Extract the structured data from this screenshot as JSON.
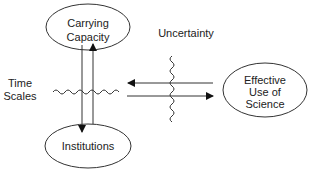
{
  "diagram": {
    "nodes": [
      {
        "id": "carrying-capacity",
        "lines": [
          "Carrying",
          "Capacity"
        ]
      },
      {
        "id": "institutions",
        "lines": [
          "Institutions"
        ]
      },
      {
        "id": "effective-use-of-science",
        "lines": [
          "Effective",
          "Use of",
          "Science"
        ]
      }
    ],
    "labels": {
      "time_scales": [
        "Time",
        "Scales"
      ],
      "uncertainty": "Uncertainty"
    },
    "edges": [
      {
        "from": "carrying-capacity",
        "to": "institutions",
        "direction": "down"
      },
      {
        "from": "institutions",
        "to": "carrying-capacity",
        "direction": "up"
      },
      {
        "from": "effective-use-of-science",
        "to": "left",
        "direction": "left"
      },
      {
        "from": "left",
        "to": "effective-use-of-science",
        "direction": "right"
      }
    ],
    "colors": {
      "stroke": "#333333",
      "text": "#222222",
      "background": "#ffffff"
    }
  }
}
